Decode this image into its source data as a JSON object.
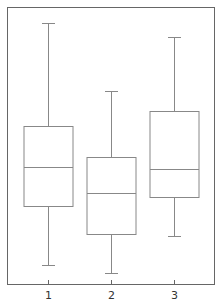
{
  "chart_data": {
    "type": "box",
    "title": "",
    "xlabel": "",
    "ylabel": "",
    "categories": [
      "1",
      "2",
      "3"
    ],
    "y_scale_note": "No y-axis ticks shown; values normalized 0-100 relative to plot frame height",
    "ylim": [
      0,
      100
    ],
    "grid": false,
    "legend": null,
    "boxes": [
      {
        "label": "1",
        "whisker_max": 94.2,
        "q3": 57.0,
        "median": 42.2,
        "q1": 28.2,
        "whisker_min": 6.9
      },
      {
        "label": "2",
        "whisker_max": 69.7,
        "q3": 45.8,
        "median": 32.9,
        "q1": 18.1,
        "whisker_min": 4.0
      },
      {
        "label": "3",
        "whisker_max": 89.2,
        "q3": 62.5,
        "median": 41.5,
        "q1": 31.4,
        "whisker_min": 17.3
      }
    ],
    "colors": {
      "frame": "#555555",
      "box": "#888888",
      "background": "#ffffff"
    }
  }
}
